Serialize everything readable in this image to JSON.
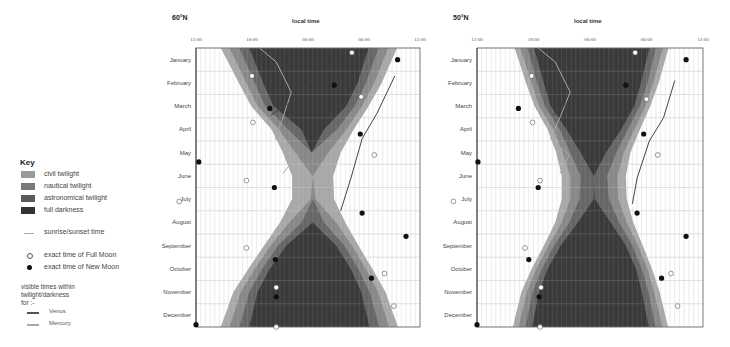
{
  "key": {
    "title": "Key",
    "items": [
      {
        "label": "civil twilight",
        "color": "#9a9a9a"
      },
      {
        "label": "nautical twilight",
        "color": "#7a7a7a"
      },
      {
        "label": "astronomical twilight",
        "color": "#5a5a5a"
      },
      {
        "label": "full darkness",
        "color": "#333333"
      }
    ],
    "sunrise_sunset": "sunrise/sunset time",
    "full_moon": "exact time of Full Moon",
    "new_moon": "exact time of New Moon",
    "visible_note_1": "visible times within",
    "visible_note_2": "twilight/darkness",
    "visible_note_3": "for :-",
    "venus": "Venus",
    "mercury": "Mercury",
    "venus_color": "#555555",
    "mercury_color": "#aaaaaa"
  },
  "chart_data": [
    {
      "type": "heatmap",
      "title": "60°N",
      "xlabel": "local time",
      "x_ticks": [
        "12:00",
        "18:00",
        "00:00",
        "06:00",
        "12:00"
      ],
      "months": [
        "January",
        "February",
        "March",
        "April",
        "May",
        "June",
        "July",
        "August",
        "September",
        "October",
        "November",
        "December"
      ],
      "sunset_h": [
        15.3,
        16.6,
        17.9,
        20.1,
        21.3,
        22.3,
        22.3,
        21.0,
        19.3,
        17.6,
        16.0,
        15.1
      ],
      "sunrise_h": [
        33.0,
        31.9,
        30.5,
        28.9,
        27.5,
        26.7,
        26.8,
        28.0,
        29.4,
        30.9,
        32.3,
        33.2
      ],
      "civil_margin_h": [
        0.9,
        0.8,
        0.7,
        0.8,
        1.3,
        2.2,
        2.0,
        1.0,
        0.7,
        0.7,
        0.8,
        0.9
      ],
      "nautical_margin_h": [
        1.9,
        1.7,
        1.5,
        1.8,
        3.5,
        6.0,
        5.5,
        2.3,
        1.5,
        1.5,
        1.7,
        1.9
      ],
      "astro_margin_h": [
        2.9,
        2.6,
        2.4,
        3.2,
        6.0,
        6.0,
        6.0,
        4.2,
        2.4,
        2.3,
        2.6,
        2.9
      ],
      "full_moons": [
        [
          28.7,
          0.2
        ],
        [
          18.0,
          1.2
        ],
        [
          29.7,
          2.1
        ],
        [
          18.1,
          3.2
        ],
        [
          31.1,
          4.6
        ],
        [
          17.4,
          5.7
        ],
        [
          10.2,
          6.6
        ],
        [
          17.4,
          8.6
        ],
        [
          32.2,
          9.7
        ],
        [
          33.2,
          11.1
        ],
        [
          20.6,
          10.3
        ],
        [
          20.6,
          12.0
        ]
      ],
      "new_moons": [
        [
          33.6,
          0.5
        ],
        [
          26.8,
          1.6
        ],
        [
          19.9,
          2.6
        ],
        [
          29.6,
          3.7
        ],
        [
          12.3,
          4.9
        ],
        [
          20.4,
          6.0
        ],
        [
          29.8,
          7.1
        ],
        [
          34.5,
          8.1
        ],
        [
          20.5,
          9.1
        ],
        [
          30.8,
          9.9
        ],
        [
          20.6,
          10.7
        ],
        [
          12.0,
          11.9
        ]
      ],
      "venus_line": [
        [
          20.0,
          2.9
        ],
        [
          22.6,
          2.2
        ],
        [
          25.0,
          1.0
        ]
      ],
      "venus_line2": [
        [
          33.3,
          1.2
        ],
        [
          31.4,
          2.8
        ],
        [
          29.8,
          3.9
        ],
        [
          28.6,
          5.6
        ],
        [
          27.5,
          7.0
        ]
      ],
      "mercury_line": [
        [
          18.8,
          0.0
        ],
        [
          20.6,
          0.6
        ],
        [
          22.2,
          1.9
        ],
        [
          21.4,
          2.9
        ],
        [
          20.5,
          3.9
        ],
        [
          22.9,
          4.6
        ],
        [
          21.3,
          5.4
        ]
      ]
    },
    {
      "type": "heatmap",
      "title": "50°N",
      "xlabel": "local time",
      "x_ticks": [
        "12:00",
        "18:00",
        "00:00",
        "06:00",
        "12:00"
      ],
      "months": [
        "January",
        "February",
        "March",
        "April",
        "May",
        "June",
        "July",
        "August",
        "September",
        "October",
        "November",
        "December"
      ],
      "sunset_h": [
        16.4,
        17.2,
        18.1,
        19.5,
        20.4,
        21.0,
        21.0,
        20.3,
        19.1,
        17.8,
        16.7,
        16.1
      ],
      "sunrise_h": [
        32.0,
        31.3,
        30.4,
        29.3,
        28.3,
        27.8,
        27.9,
        28.6,
        29.6,
        30.6,
        31.4,
        32.0
      ],
      "civil_margin_h": [
        0.6,
        0.6,
        0.5,
        0.6,
        0.7,
        0.9,
        0.9,
        0.7,
        0.5,
        0.5,
        0.6,
        0.6
      ],
      "nautical_margin_h": [
        1.3,
        1.2,
        1.1,
        1.3,
        1.5,
        2.0,
        1.9,
        1.5,
        1.1,
        1.1,
        1.2,
        1.3
      ],
      "astro_margin_h": [
        2.0,
        1.9,
        1.7,
        2.0,
        2.6,
        3.5,
        3.4,
        2.4,
        1.8,
        1.7,
        1.9,
        2.0
      ],
      "full_moons": [
        [
          28.8,
          0.2
        ],
        [
          17.8,
          1.2
        ],
        [
          30.0,
          2.2
        ],
        [
          17.9,
          3.2
        ],
        [
          31.2,
          4.6
        ],
        [
          18.7,
          5.7
        ],
        [
          9.5,
          6.6
        ],
        [
          17.1,
          8.6
        ],
        [
          32.6,
          9.7
        ],
        [
          33.3,
          11.1
        ],
        [
          18.8,
          10.3
        ],
        [
          18.7,
          12.0
        ]
      ],
      "new_moons": [
        [
          34.2,
          0.5
        ],
        [
          27.8,
          1.6
        ],
        [
          16.4,
          2.6
        ],
        [
          29.7,
          3.7
        ],
        [
          12.1,
          4.9
        ],
        [
          18.5,
          6.0
        ],
        [
          29.0,
          7.1
        ],
        [
          34.2,
          8.1
        ],
        [
          17.5,
          9.1
        ],
        [
          31.6,
          9.9
        ],
        [
          18.6,
          10.7
        ],
        [
          12.0,
          11.9
        ]
      ],
      "venus_line": [
        [
          20.0,
          2.9
        ],
        [
          22.0,
          2.2
        ],
        [
          24.4,
          1.0
        ]
      ],
      "venus_line2": [
        [
          33.0,
          1.4
        ],
        [
          31.8,
          3.0
        ],
        [
          30.3,
          4.0
        ],
        [
          29.0,
          5.6
        ],
        [
          28.5,
          6.7
        ]
      ],
      "mercury_line": [
        [
          18.5,
          0.0
        ],
        [
          20.3,
          0.6
        ],
        [
          21.9,
          1.9
        ],
        [
          20.9,
          2.9
        ],
        [
          19.8,
          3.9
        ],
        [
          21.8,
          4.6
        ],
        [
          20.8,
          5.4
        ]
      ]
    }
  ]
}
